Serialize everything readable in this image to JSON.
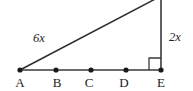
{
  "diagram": {
    "type": "right-triangle-with-segmented-base",
    "background_color": "#ffffff",
    "stroke_color": "#3a3a3a",
    "geometry": {
      "baseline": {
        "y": 70,
        "x_start": 20,
        "x_end": 161
      },
      "vertical_leg": {
        "x": 161,
        "y_top": 0,
        "y_bottom": 70
      },
      "hypotenuse": {
        "x1": 20,
        "y1": 70,
        "x2": 161,
        "y2": -4
      },
      "right_angle_marker": {
        "x": 149,
        "y": 58,
        "size": 12,
        "at_vertex": "E"
      }
    },
    "points": [
      {
        "id": "A",
        "label": "A",
        "x": 20,
        "y": 70
      },
      {
        "id": "B",
        "label": "B",
        "x": 56,
        "y": 70
      },
      {
        "id": "C",
        "label": "C",
        "x": 91,
        "y": 70
      },
      {
        "id": "D",
        "label": "D",
        "x": 126,
        "y": 70
      },
      {
        "id": "E",
        "label": "E",
        "x": 161,
        "y": 70
      }
    ],
    "measurements": [
      {
        "id": "hypotenuse-length",
        "label": "6x",
        "side": "hypotenuse"
      },
      {
        "id": "vertical-length",
        "label": "2x",
        "side": "vertical-leg"
      }
    ]
  }
}
